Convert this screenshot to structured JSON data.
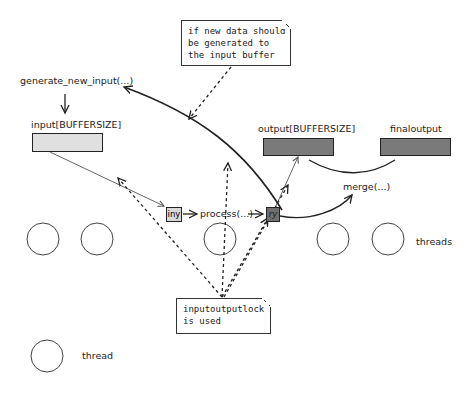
{
  "notes": {
    "top": {
      "lines": [
        "if new data should",
        "be generated to",
        "the input buffer"
      ]
    },
    "bottom": {
      "lines": [
        "inputoutputlock",
        "is used"
      ]
    }
  },
  "labels": {
    "generate": "generate_new_input(...)",
    "input_buffer": "input[BUFFERSIZE]",
    "output_buffer": "output[BUFFERSIZE]",
    "final_output": "finaloutput",
    "process": "process(...)",
    "merge": "merge(...)",
    "threads": "threads",
    "thread": "thread"
  },
  "boxes": {
    "input_item": "iny",
    "output_item": "ry"
  },
  "colors": {
    "input_buffer_fill": "#e0e0e0",
    "output_buffer_fill": "#7a7a7a",
    "final_output_fill": "#7a7a7a",
    "input_item_fill": "#d8d8d8",
    "output_item_fill": "#6e6e6e",
    "line": "#222222"
  }
}
